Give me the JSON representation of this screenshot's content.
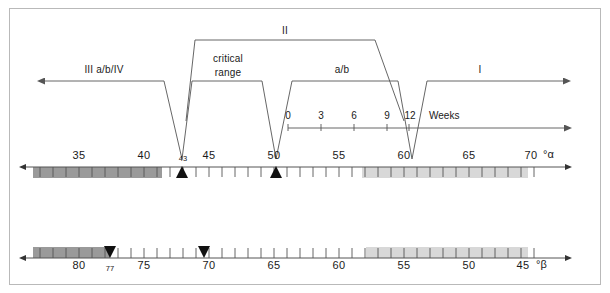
{
  "figure": {
    "border_color": "#b9b9b9",
    "line_color": "#555555",
    "band_dark": "#9a9a9a",
    "band_light": "#d8d8d8",
    "text_color": "#1a1a1a"
  },
  "regions": [
    {
      "id": "III a/b/IV",
      "label": "III a/b/IV"
    },
    {
      "id": "critical range",
      "label_line1": "critical",
      "label_line2": "range"
    },
    {
      "id": "II",
      "label": "II"
    },
    {
      "id": "a/b",
      "label": "a/b"
    },
    {
      "id": "I",
      "label": "I"
    }
  ],
  "weeks_axis": {
    "label": "Weeks",
    "ticks": [
      "0",
      "3",
      "6",
      "9",
      "12"
    ],
    "values": [
      0,
      3,
      6,
      9,
      12
    ]
  },
  "alpha_scale": {
    "unit": "°α",
    "direction": "left-arrow-and-right-arrow",
    "range": [
      32,
      71
    ],
    "major_labels": [
      "35",
      "40",
      "45",
      "50",
      "55",
      "60",
      "65",
      "70"
    ],
    "major_values": [
      35,
      40,
      45,
      50,
      55,
      60,
      65,
      70
    ],
    "minor_label": "43",
    "minor_value": 43,
    "markers": [
      {
        "value": 43,
        "shape": "triangle-up"
      },
      {
        "value": 50,
        "shape": "triangle-up"
      }
    ],
    "bands": [
      {
        "from": 32,
        "to": 43,
        "color": "#9a9a9a",
        "name": "dark-band"
      },
      {
        "from": 60,
        "to": 70.5,
        "color": "#d8d8d8",
        "name": "light-band"
      }
    ]
  },
  "beta_scale": {
    "unit": "°β",
    "direction": "right-to-left",
    "range": [
      83,
      43
    ],
    "major_labels": [
      "80",
      "75",
      "70",
      "65",
      "60",
      "55",
      "50",
      "45"
    ],
    "major_values": [
      80,
      75,
      70,
      65,
      60,
      55,
      50,
      45
    ],
    "minor_label": "77",
    "minor_value": 77,
    "markers": [
      {
        "value": 77,
        "shape": "triangle-down"
      },
      {
        "value": 70,
        "shape": "triangle-down"
      }
    ],
    "bands": [
      {
        "from": 83,
        "to": 77,
        "color": "#9a9a9a",
        "name": "dark-band"
      },
      {
        "from": 55,
        "to": 44,
        "color": "#d8d8d8",
        "name": "light-band"
      }
    ]
  }
}
